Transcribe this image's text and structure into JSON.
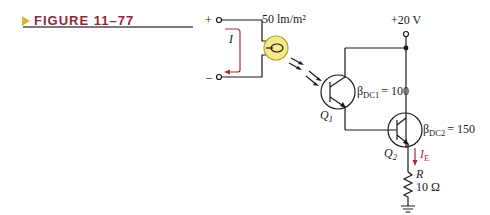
{
  "figure": {
    "label": "FIGURE 11–77",
    "arrow_color": "#e3b23c",
    "title_color": "#8c2a3c"
  },
  "circuit": {
    "terminals": {
      "plus": "+",
      "minus": "–"
    },
    "current_label": "I",
    "photocell": {
      "illumination": "50 lm/m²",
      "fill": "#f5e98a"
    },
    "supply": {
      "label": "+20 V"
    },
    "q1": {
      "name": "Q",
      "sub": "1",
      "beta": "β",
      "beta_sub": "DC1",
      "beta_value": "= 100"
    },
    "q2": {
      "name": "Q",
      "sub": "2",
      "beta": "β",
      "beta_sub": "DC2",
      "beta_value": "= 150"
    },
    "emitter_current": {
      "name": "I",
      "sub": "E"
    },
    "resistor": {
      "name": "R",
      "value": "10 Ω"
    }
  }
}
